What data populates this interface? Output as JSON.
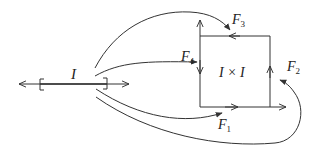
{
  "diagram": {
    "type": "mapping-diagram",
    "colors": {
      "stroke": "#333333",
      "text": "#222222",
      "background": "#ffffff"
    },
    "interval": {
      "label": "I",
      "bracket_left": "[",
      "bracket_right": "]"
    },
    "square": {
      "label": "I × I"
    },
    "maps": [
      {
        "id": "F1",
        "name": "F",
        "sub": "1",
        "target": "bottom edge"
      },
      {
        "id": "F2",
        "name": "F",
        "sub": "2",
        "target": "right edge"
      },
      {
        "id": "F3",
        "name": "F",
        "sub": "3",
        "target": "top edge"
      },
      {
        "id": "F4",
        "name": "F",
        "sub": "4",
        "target": "left edge"
      }
    ]
  }
}
